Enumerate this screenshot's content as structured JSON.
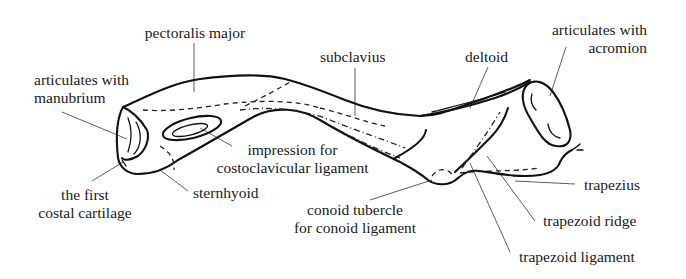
{
  "figure": {
    "labels": {
      "pectoralis_major": "pectoralis major",
      "articulates_manubrium_1": "articulates with",
      "articulates_manubrium_2": "manubrium",
      "subclavius": "subclavius",
      "deltoid": "deltoid",
      "articulates_acromion_1": "articulates with",
      "articulates_acromion_2": "acromion",
      "impression_1": "impression for",
      "impression_2": "costoclavicular ligament",
      "first_costal_1": "the first",
      "first_costal_2": "costal cartilage",
      "sternhyoid": "sternhyoid",
      "conoid_1": "conoid tubercle",
      "conoid_2": "for conoid ligament",
      "trapezius": "trapezius",
      "trapezoid_ridge": "trapezoid ridge",
      "trapezoid_ligament": "trapezoid ligament"
    },
    "colors": {
      "ink": "#111111",
      "background": "#ffffff"
    }
  }
}
